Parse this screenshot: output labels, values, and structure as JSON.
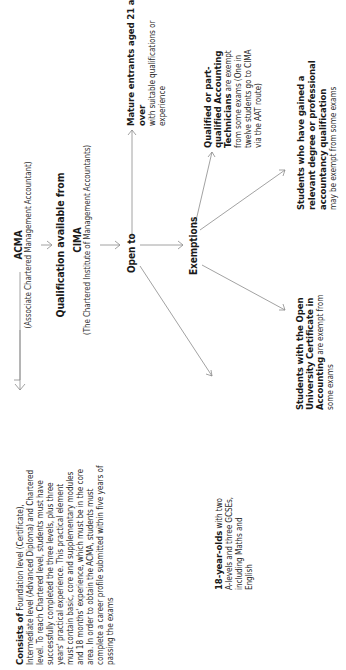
{
  "diagram": {
    "acma": {
      "title": "ACMA",
      "subtitle": "(Associate Chartered Management Accountant)"
    },
    "qualification": {
      "label": "Qualification available from"
    },
    "cima": {
      "title": "CIMA",
      "subtitle": "(The Chartered Institute of Management Accountants)"
    },
    "consists": {
      "lead": "Consists of",
      "text": " Foundation level (Certificate), Intermediate level (Advanced Diploma) and Chartered level. To reach Chartered level, students must have successfully completed the three levels, plus three years' practical experience. This practical element must contain basic, core and supplementary modules and 18 months' experience, which must be in the core area. In order to obtain the ACMA, students must complete a career profile submitted within five years of passing the exams"
    },
    "open_to": {
      "label": "Open to"
    },
    "mature": {
      "lead": "Mature entrants aged 21 and over",
      "text": "with suitable qualifications or experience"
    },
    "eighteen": {
      "lead": "18-year-olds",
      "text": " with two A-levels and three GCSEs, including Maths and English"
    },
    "exemptions": {
      "label": "Exemptions"
    },
    "technicians": {
      "lead": "Qualified or part-qualified Accounting Technicians",
      "text": " are exempt from some exams (One in twelve students go to CIMA via the AAT route)"
    },
    "degree": {
      "lead": "Students who have gained a relevant degree or professional accountancy qualification",
      "text": "may be exempt from some exams"
    },
    "open_university": {
      "lead": "Students with the Open University Certificate in Accounting",
      "text": " are exempt from some exams"
    }
  },
  "colors": {
    "text": "#2a2a2a",
    "lines": "#8a8a8a",
    "background": "#ffffff"
  }
}
